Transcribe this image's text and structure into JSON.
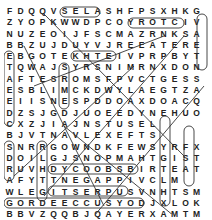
{
  "puzzle": {
    "rows": [
      "FDQQVSELASHFPSXHKGX",
      "ZYOPKWWDPCOYROTCIVT",
      "NUZEOIJFSCMAZRNKSA",
      "BBZUJDUYVJREEATERE",
      "EBGOTEKHTEIVPRPBYT",
      "TQWAJSYRSNIMRNXDON",
      "AFTESROMSFPVCTGESS",
      "ESBLIMCKDWYLAEGTZA",
      "EIISNESPDDOAXDOACQR",
      "DZSJGDJUOEEDYNEHUO",
      "CXZJIAJNSTUSEL",
      "BJVTNAVLEXEFTS",
      "SNRRGOWNDKFEWSYRFX",
      "DOILGJSNOPMAHTGIST",
      "RUVHDYCOOBSBIRTEAT",
      "AFYTTNEGAPPIVCLM",
      "WLEGITSERPUSVNHTSM",
      "GORDEECCUSYODJXLOK",
      "BBVZQQBJQAYERXAMTM",
      "CHMHKDBOQQEWRXKGDMDD"
    ],
    "colors": {
      "text": "#222222",
      "lines": "#333333",
      "background": "#ffffff"
    }
  }
}
